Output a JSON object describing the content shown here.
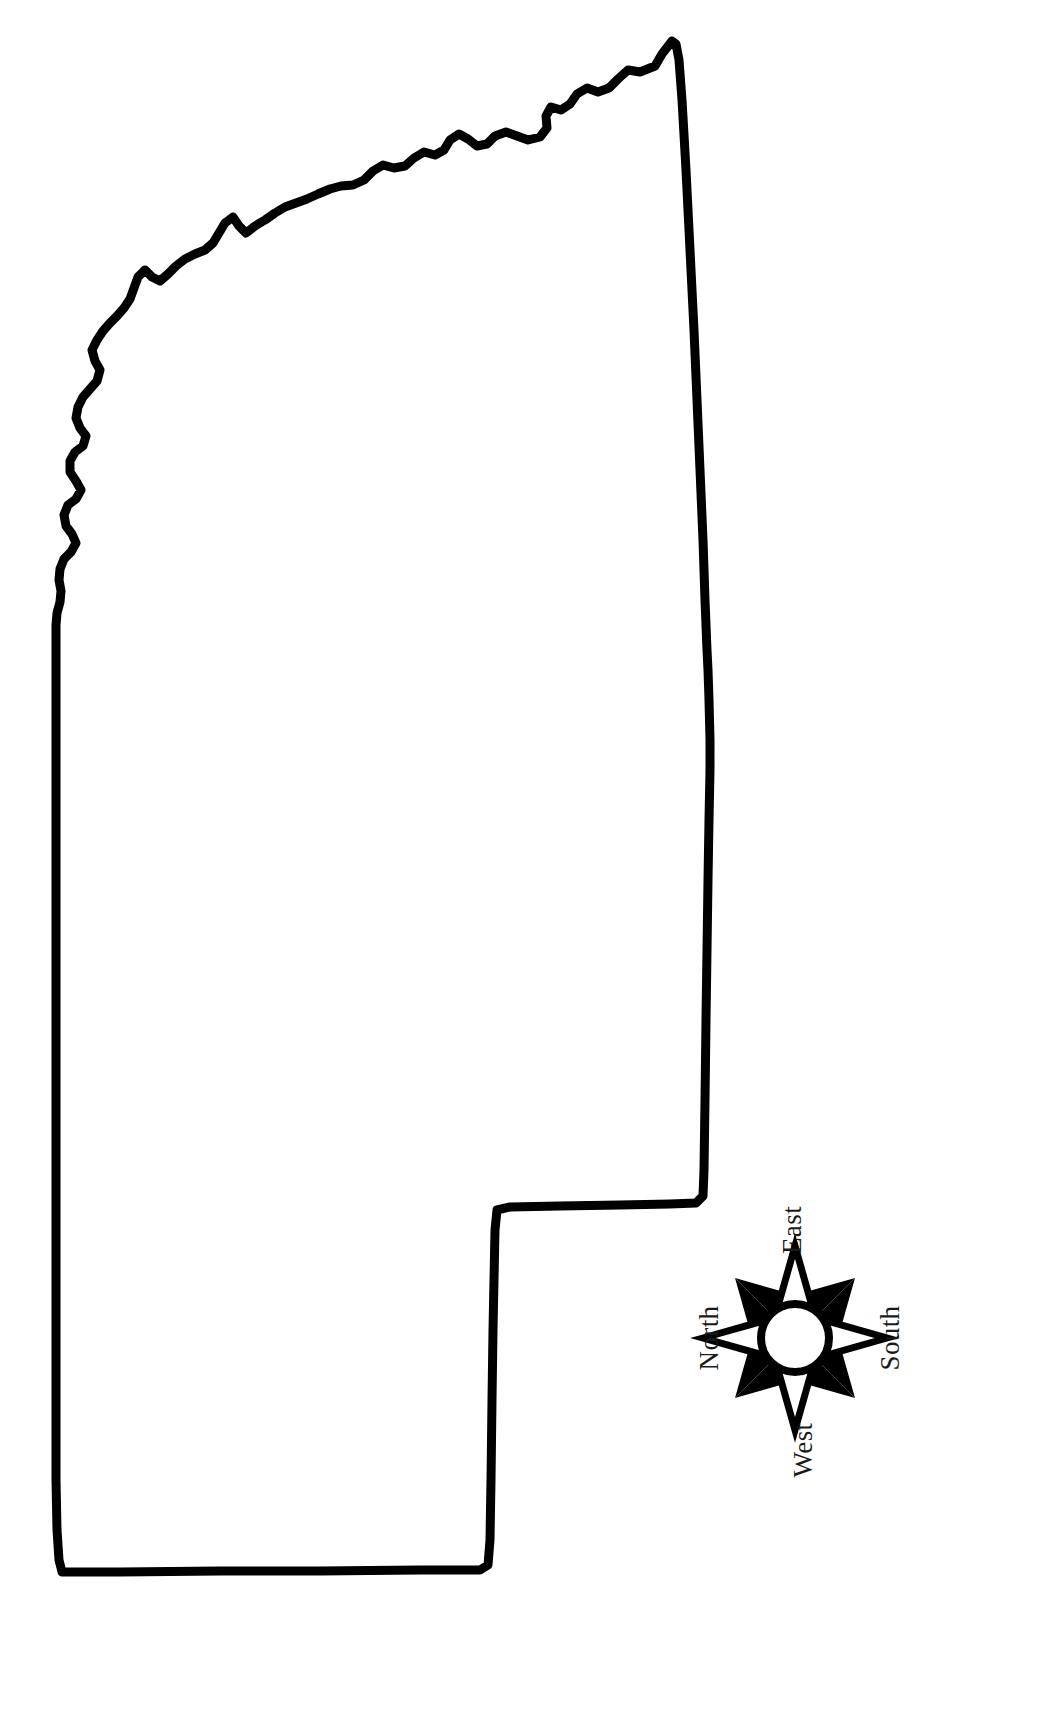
{
  "page": {
    "background_color": "#ffffff",
    "outline_color": "#000000",
    "width": 1042,
    "height": 1717
  },
  "map": {
    "name": "state-outline",
    "description": "Blank black-line outline of the state of Mississippi, rotated 90 degrees counter-clockwise so that North points to the left of the page.",
    "orientation": "rotated-90-ccw",
    "fill_color": "#ffffff",
    "stroke_color": "#000000",
    "stroke_width": 9
  },
  "compass": {
    "name": "compass-rose",
    "style": "eight-point-star",
    "rotation_degrees": -90,
    "center_x": 795,
    "center_y": 1338,
    "hub_radius": 34,
    "point_long": 92,
    "point_short": 66,
    "dark_color": "#000000",
    "light_color": "#ffffff",
    "labels": {
      "north": "North",
      "east": "East",
      "south": "South",
      "west": "West"
    },
    "label_positions": {
      "north": {
        "x": 712,
        "y": 1338,
        "rotate": -90
      },
      "east": {
        "x": 795,
        "y": 1238,
        "rotate": -90
      },
      "south": {
        "x": 890,
        "y": 1338,
        "rotate": -90
      },
      "west": {
        "x": 808,
        "y": 1448,
        "rotate": -90
      }
    }
  }
}
